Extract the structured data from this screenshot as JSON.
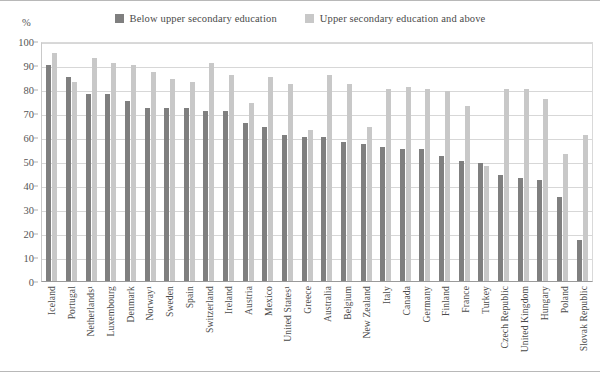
{
  "axis": {
    "unit_label": "%",
    "yticks": [
      0,
      10,
      20,
      30,
      40,
      50,
      60,
      70,
      80,
      90,
      100
    ]
  },
  "legend": [
    {
      "name": "legend-swatch-below",
      "label": "Below upper secondary education",
      "color": "#7f7f7f"
    },
    {
      "name": "legend-swatch-upper",
      "label": "Upper secondary education and above",
      "color": "#c8c8c8"
    }
  ],
  "chart_data": {
    "type": "bar",
    "title": "",
    "xlabel": "",
    "ylabel": "%",
    "ylim": [
      0,
      100
    ],
    "grid": true,
    "legend_position": "top-center",
    "categories": [
      "Iceland",
      "Portugal",
      "Netherlands¹",
      "Luxembourg",
      "Denmark",
      "Norway¹",
      "Sweden",
      "Spain",
      "Switzerland",
      "Ireland",
      "Austria",
      "Mexico",
      "United States¹",
      "Greece",
      "Australia",
      "Belgium",
      "New Zealand",
      "Italy",
      "Canada",
      "Germany",
      "Finland",
      "France",
      "Turkey",
      "Czech Republic",
      "United Kingdom",
      "Hungary",
      "Poland",
      "Slovak Republic"
    ],
    "series": [
      {
        "name": "Below upper secondary education",
        "color": "#7f7f7f",
        "values": [
          90,
          85,
          78,
          78,
          75,
          72,
          72,
          72,
          71,
          71,
          66,
          64,
          61,
          60,
          60,
          58,
          57,
          56,
          55,
          55,
          52,
          50,
          49,
          44,
          43,
          42,
          35,
          17
        ]
      },
      {
        "name": "Upper secondary education and above",
        "color": "#c8c8c8",
        "values": [
          95,
          83,
          93,
          91,
          90,
          87,
          84,
          83,
          91,
          86,
          74,
          85,
          82,
          63,
          86,
          82,
          64,
          80,
          81,
          80,
          79,
          73,
          48,
          80,
          80,
          76,
          53,
          61
        ]
      }
    ]
  }
}
